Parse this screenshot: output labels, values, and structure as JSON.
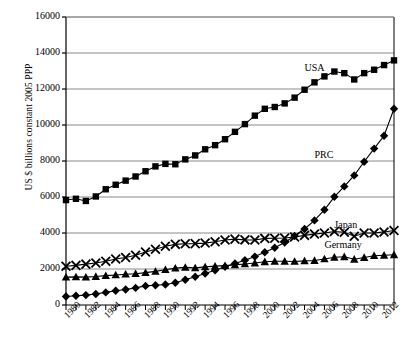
{
  "chart_data": {
    "type": "line",
    "title": "",
    "xlabel": "",
    "ylabel": "US $ billions constant 2005 PPP",
    "ylim": [
      0,
      16000
    ],
    "ytick_values": [
      0,
      2000,
      4000,
      6000,
      8000,
      10000,
      12000,
      14000,
      16000
    ],
    "ytick_labels": [
      "0",
      "2000",
      "4000",
      "6000",
      "8000",
      "10000",
      "12000",
      "14000",
      "16000"
    ],
    "xlim": [
      1980,
      2013
    ],
    "xtick_values": [
      1980,
      1982,
      1984,
      1986,
      1988,
      1990,
      1992,
      1994,
      1996,
      1998,
      2000,
      2002,
      2004,
      2006,
      2008,
      2010,
      2012
    ],
    "xtick_labels": [
      "1980",
      "1982",
      "1984",
      "1986",
      "1988",
      "1990",
      "1992",
      "1994",
      "1996",
      "1998",
      "2000",
      "2002",
      "2004",
      "2006",
      "2008",
      "2010",
      "2012"
    ],
    "x": [
      1980,
      1981,
      1982,
      1983,
      1984,
      1985,
      1986,
      1987,
      1988,
      1989,
      1990,
      1991,
      1992,
      1993,
      1994,
      1995,
      1996,
      1997,
      1998,
      1999,
      2000,
      2001,
      2002,
      2003,
      2004,
      2005,
      2006,
      2007,
      2008,
      2009,
      2010,
      2011,
      2012,
      2013
    ],
    "grid": "horizontal",
    "legend_position": "inline-annotations",
    "series": [
      {
        "name": "USA",
        "marker": "square",
        "color": "#000000",
        "label_x": 2004,
        "label_y": 13100,
        "values": [
          5830,
          5900,
          5780,
          6030,
          6430,
          6680,
          6910,
          7140,
          7430,
          7700,
          7840,
          7820,
          8090,
          8310,
          8650,
          8880,
          9210,
          9620,
          10050,
          10520,
          10900,
          11000,
          11200,
          11520,
          11960,
          12370,
          12700,
          12970,
          12880,
          12530,
          12880,
          13070,
          13330,
          13590
        ],
        "annotation_note": "peak 2007-2008 then dip 2009"
      },
      {
        "name": "PRC",
        "marker": "diamond",
        "color": "#000000",
        "label_x": 2005,
        "label_y": 8300,
        "values": [
          470,
          510,
          550,
          610,
          700,
          790,
          860,
          950,
          1060,
          1100,
          1140,
          1240,
          1400,
          1570,
          1750,
          1930,
          2120,
          2310,
          2490,
          2690,
          2930,
          3180,
          3470,
          3830,
          4220,
          4700,
          5290,
          6010,
          6590,
          7200,
          7960,
          8690,
          9400,
          10900
        ]
      },
      {
        "name": "Japan",
        "marker": "x",
        "color": "#000000",
        "label_x": 2007,
        "label_y": 4400,
        "values": [
          2150,
          2200,
          2270,
          2330,
          2430,
          2560,
          2640,
          2760,
          2940,
          3100,
          3260,
          3370,
          3400,
          3410,
          3440,
          3510,
          3610,
          3660,
          3620,
          3610,
          3700,
          3710,
          3720,
          3780,
          3870,
          3940,
          4000,
          4080,
          4040,
          3820,
          4000,
          4000,
          4060,
          4140
        ]
      },
      {
        "name": "Germany",
        "marker": "triangle",
        "color": "#000000",
        "label_x": 2006,
        "label_y": 3300,
        "values": [
          1550,
          1560,
          1550,
          1580,
          1630,
          1670,
          1710,
          1740,
          1800,
          1870,
          1960,
          2050,
          2090,
          2060,
          2120,
          2160,
          2190,
          2230,
          2280,
          2330,
          2400,
          2430,
          2430,
          2420,
          2450,
          2470,
          2560,
          2650,
          2680,
          2540,
          2640,
          2740,
          2760,
          2790
        ]
      }
    ]
  }
}
